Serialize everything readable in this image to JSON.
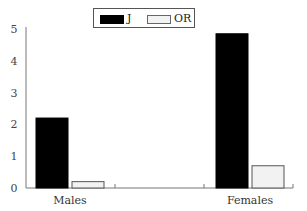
{
  "chart_data": {
    "type": "bar",
    "title": "",
    "xlabel": "",
    "ylabel": "",
    "categories": [
      "Males",
      "Females"
    ],
    "series": [
      {
        "name": "J",
        "color": "#000000",
        "values": [
          2.2,
          4.85
        ]
      },
      {
        "name": "OR",
        "color": "#f2f2f2",
        "values": [
          0.2,
          0.7
        ]
      }
    ],
    "ylim": [
      0,
      5
    ],
    "yticks": [
      0,
      1,
      2,
      3,
      4,
      5
    ],
    "grid": false,
    "legend_position": "top-center"
  },
  "legend": {
    "items": [
      {
        "label": "J",
        "color": "#000000"
      },
      {
        "label": "OR",
        "color": "#f2f2f2"
      }
    ]
  }
}
